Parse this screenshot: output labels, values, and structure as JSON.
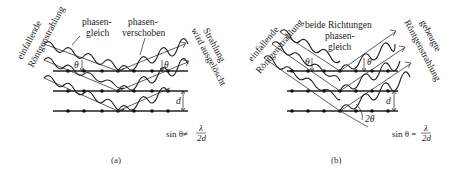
{
  "figure": {
    "panels": [
      {
        "id": "a",
        "caption": "(a)",
        "labels": {
          "incident": [
            "einfallende",
            "Röntgenstrahlung"
          ],
          "in_phase": [
            "phasen-",
            "gleich"
          ],
          "phase_shifted": [
            "phasen-",
            "verschoben"
          ],
          "cancelled": [
            "Strahlung",
            "wird ausgelöscht"
          ],
          "theta_left": "θ",
          "theta_right": "θ",
          "spacing": "d"
        },
        "formula": {
          "lhs": "sin θ≠",
          "numerator": "λ",
          "denominator": "2d"
        }
      },
      {
        "id": "b",
        "caption": "(b)",
        "labels": {
          "incident": [
            "einfallende",
            "Röntgenstrahlung"
          ],
          "both_in_phase": [
            "beide Richtungen",
            "phasen-",
            "gleich"
          ],
          "diffracted": [
            "gebeugte",
            "Röntgenstrahlung"
          ],
          "theta_left": "θ",
          "theta_right": "θ",
          "spacing": "d",
          "double_angle": "2θ"
        },
        "formula": {
          "lhs": "sin θ =",
          "numerator": "λ",
          "denominator": "2d"
        }
      }
    ]
  }
}
